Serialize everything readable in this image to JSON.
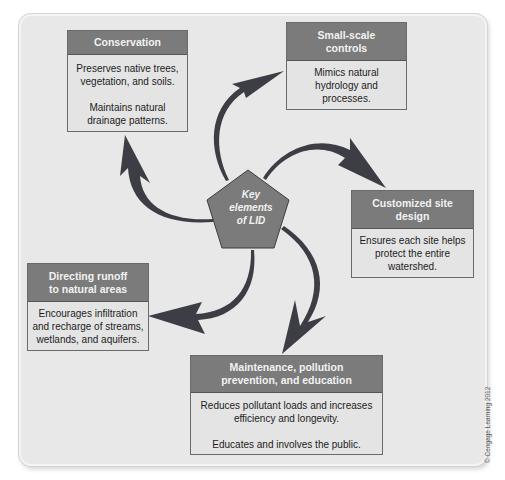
{
  "diagram": {
    "type": "radial-concept-diagram",
    "center": {
      "label": "Key elements of LID",
      "lines": [
        "Key",
        "elements",
        "of LID"
      ],
      "shape": "pentagon"
    },
    "nodes": [
      {
        "id": "conservation",
        "title": "Conservation",
        "body": [
          "Preserves native trees, vegetation, and soils.",
          "Maintains natural drainage patterns."
        ]
      },
      {
        "id": "small-scale-controls",
        "title": "Small-scale controls",
        "body": [
          "Mimics natural hydrology and processes."
        ]
      },
      {
        "id": "customized-site-design",
        "title": "Customized site design",
        "body": [
          "Ensures each site helps protect the entire watershed."
        ]
      },
      {
        "id": "maintenance",
        "title": "Maintenance, pollution prevention, and education",
        "body": [
          "Reduces pollutant loads and increases efficiency and longevity.",
          "Educates and involves the public."
        ]
      },
      {
        "id": "directing-runoff",
        "title": "Directing runoff to natural areas",
        "body": [
          "Encourages infiltration and recharge of streams, wetlands, and aquifers."
        ]
      }
    ],
    "edges": [
      {
        "from": "center",
        "to": "conservation"
      },
      {
        "from": "center",
        "to": "small-scale-controls"
      },
      {
        "from": "center",
        "to": "customized-site-design"
      },
      {
        "from": "center",
        "to": "maintenance"
      },
      {
        "from": "center",
        "to": "directing-runoff"
      }
    ],
    "credit": "© Cengage Learning 2012"
  },
  "colors": {
    "panel_bg": "#e8e8e8",
    "header_bg": "#7b7b7b",
    "box_bg": "#e4e4e4",
    "arrow": "#3d3d46",
    "pentagon": "#7b7b7b"
  }
}
